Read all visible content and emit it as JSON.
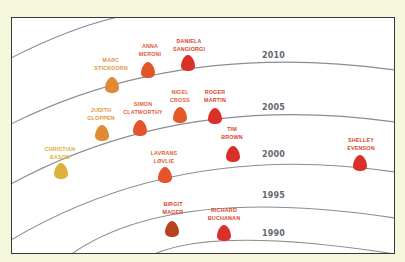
{
  "diagram": {
    "colors": {
      "background": "#f4f7dc",
      "panel": "#ffffff",
      "frame": "#3a3a3a",
      "arc": "#8a8d94",
      "year_text": "#66676b"
    },
    "arcs": [
      {
        "id": "arc-top",
        "d": "M11,58 Q70,28 118,17"
      },
      {
        "id": "arc-2010",
        "d": "M11,124 Q180,40 395,70"
      },
      {
        "id": "arc-2005",
        "d": "M11,184 Q180,92 395,122"
      },
      {
        "id": "arc-2000",
        "d": "M11,240 Q180,140 395,172"
      },
      {
        "id": "arc-1995",
        "d": "M70,255 Q170,184 395,218"
      },
      {
        "id": "arc-1990",
        "d": "M152,255 Q215,226 395,254"
      }
    ],
    "years": [
      {
        "label": "2010",
        "x": 262,
        "y": 58
      },
      {
        "label": "2005",
        "x": 262,
        "y": 110
      },
      {
        "label": "2000",
        "x": 262,
        "y": 157
      },
      {
        "label": "1995",
        "x": 262,
        "y": 198
      },
      {
        "label": "1990",
        "x": 262,
        "y": 236
      }
    ],
    "people": [
      {
        "first": "DANIELA",
        "last": "SANGIORGI",
        "year": 2010,
        "x": 188,
        "y": 63,
        "color": "#d9302a"
      },
      {
        "first": "ANNA",
        "last": "MERONI",
        "year": 2009,
        "x": 148,
        "y": 70,
        "color": "#e2542a"
      },
      {
        "first": "MARC",
        "last": "STICKDORN",
        "year": 2008,
        "x": 112,
        "y": 85,
        "color": "#e08a35"
      },
      {
        "first": "NIGEL",
        "last": "CROSS",
        "year": 2005,
        "x": 180,
        "y": 115,
        "color": "#e35a28"
      },
      {
        "first": "ROGER",
        "last": "MARTIN",
        "year": 2005,
        "x": 215,
        "y": 116,
        "color": "#d9302a"
      },
      {
        "first": "SIMON",
        "last": "CLATWORTHY",
        "year": 2004,
        "x": 140,
        "y": 128,
        "color": "#e2542a"
      },
      {
        "first": "JUDITH",
        "last": "GLOPPEN",
        "year": 2003,
        "x": 102,
        "y": 133,
        "color": "#e08a35"
      },
      {
        "first": "CHRISTIAN",
        "last": "BASON",
        "year": 2001,
        "x": 61,
        "y": 171,
        "color": "#dcb23a"
      },
      {
        "first": "TIM",
        "last": "BROWN",
        "year": 2000,
        "x": 233,
        "y": 154,
        "color": "#d9302a"
      },
      {
        "first": "SHELLEY",
        "last": "EVENSON",
        "year": 2000,
        "x": 360,
        "y": 163,
        "color": "#d9302a"
      },
      {
        "first": "LAVRANS",
        "last": "LØVLIE",
        "year": 1999,
        "x": 165,
        "y": 175,
        "color": "#e2542a"
      },
      {
        "first": "BIRGIT",
        "last": "MAGER",
        "year": 1992,
        "x": 172,
        "y": 229,
        "color": "#b8441d"
      },
      {
        "first": "RICHARD",
        "last": "BUCHANAN",
        "year": 1990,
        "x": 224,
        "y": 233,
        "color": "#d9302a"
      }
    ],
    "labels": [
      {
        "x": 189,
        "y": 43,
        "color": "#d9452b"
      },
      {
        "x": 150,
        "y": 48,
        "color": "#e0603a"
      },
      {
        "x": 111,
        "y": 62,
        "color": "#e0963c"
      },
      {
        "x": 180,
        "y": 94,
        "color": "#e0603a"
      },
      {
        "x": 215,
        "y": 94,
        "color": "#d9452b"
      },
      {
        "x": 143,
        "y": 106,
        "color": "#e0603a"
      },
      {
        "x": 101,
        "y": 112,
        "color": "#e0963c"
      },
      {
        "x": 60,
        "y": 151,
        "color": "#dcb23a"
      },
      {
        "x": 232,
        "y": 131,
        "color": "#d9452b"
      },
      {
        "x": 361,
        "y": 142,
        "color": "#d9452b"
      },
      {
        "x": 164,
        "y": 155,
        "color": "#e0603a"
      },
      {
        "x": 173,
        "y": 206,
        "color": "#d9452b"
      },
      {
        "x": 224,
        "y": 212,
        "color": "#d9452b"
      }
    ]
  }
}
